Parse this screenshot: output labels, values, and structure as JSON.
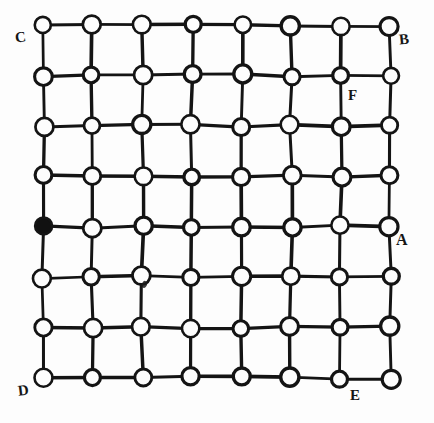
{
  "figure": {
    "type": "lattice-graph-diagram",
    "grid": {
      "rows": 8,
      "cols": 8,
      "origin_x": 43,
      "origin_y": 25,
      "spacing_x": 49.6,
      "spacing_y": 50.4,
      "node_radius": 8.5,
      "edge_stroke_width": 3.2,
      "node_stroke_width": 3.0
    },
    "colors": {
      "ink": "#141414",
      "paper": "#fdfdfd",
      "filled_node": "#111111"
    },
    "filled_nodes": [
      {
        "row": 4,
        "col": 0
      }
    ],
    "labels": [
      {
        "id": "A",
        "text": "A",
        "row": 4,
        "col": 7,
        "position": "right-below"
      },
      {
        "id": "B",
        "text": "B",
        "row": 0,
        "col": 7,
        "position": "right-below"
      },
      {
        "id": "C",
        "text": "C",
        "row": 0,
        "col": 0,
        "position": "left-below"
      },
      {
        "id": "D",
        "text": "D",
        "row": 7,
        "col": 0,
        "position": "left-below"
      },
      {
        "id": "E",
        "text": "E",
        "row": 7,
        "col": 6,
        "position": "right-below"
      },
      {
        "id": "F",
        "text": "F",
        "row": 1,
        "col": 6,
        "position": "right-below"
      }
    ],
    "artifacts": [
      {
        "id": "ink-smudge",
        "near_row": 5,
        "near_col": 2
      }
    ]
  }
}
